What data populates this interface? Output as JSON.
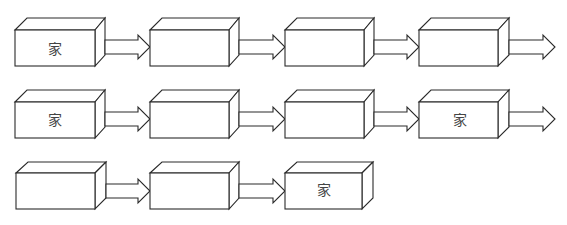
{
  "diagram": {
    "box_label": "家",
    "rows": [
      {
        "boxes": [
          {
            "label": "家"
          },
          {
            "label": ""
          },
          {
            "label": ""
          },
          {
            "label": ""
          }
        ],
        "trailing_arrow": true
      },
      {
        "boxes": [
          {
            "label": "家"
          },
          {
            "label": ""
          },
          {
            "label": ""
          },
          {
            "label": "家"
          }
        ],
        "trailing_arrow": true
      },
      {
        "boxes": [
          {
            "label": ""
          },
          {
            "label": ""
          },
          {
            "label": "家"
          }
        ],
        "trailing_arrow": false
      }
    ]
  }
}
